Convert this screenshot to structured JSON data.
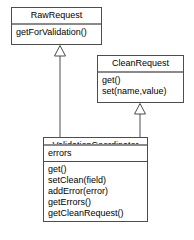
{
  "diagram": {
    "kind": "uml-class-diagram",
    "width": 194,
    "height": 240,
    "background_color": "#ffffff",
    "line_color": "#4d4d4d",
    "separator_color": "#8a8a8a",
    "text_color": "#000000"
  },
  "classes": {
    "raw_request": {
      "name": "RawRequest",
      "attributes": [],
      "methods": [
        "getForValidation()"
      ]
    },
    "clean_request": {
      "name": "CleanRequest",
      "attributes": [],
      "methods": [
        "get()",
        "set(name,value)"
      ]
    },
    "validation_coordinator": {
      "name": "ValidationCoordinator",
      "attributes": [
        "errors"
      ],
      "methods": [
        "get()",
        "setClean(field)",
        "addError(error)",
        "getErrors()",
        "getCleanRequest()"
      ]
    }
  },
  "relationships": [
    {
      "type": "generalization",
      "label": "",
      "from": "ValidationCoordinator",
      "to": "RawRequest",
      "arrowhead": "hollow-triangle"
    },
    {
      "type": "generalization",
      "label": "",
      "from": "ValidationCoordinator",
      "to": "CleanRequest",
      "arrowhead": "hollow-triangle"
    }
  ]
}
